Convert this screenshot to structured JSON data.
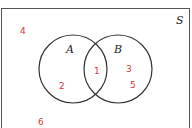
{
  "diagram": {
    "type": "venn",
    "universe_label": "S",
    "sets": [
      {
        "name": "A"
      },
      {
        "name": "B"
      }
    ],
    "regions": {
      "outside": [
        "4",
        "6"
      ],
      "A_only": [
        "2"
      ],
      "A_and_B": [
        "1"
      ],
      "B_only": [
        "3",
        "5"
      ]
    },
    "colors": {
      "number": "#d23a3a",
      "line": "#333333"
    }
  }
}
